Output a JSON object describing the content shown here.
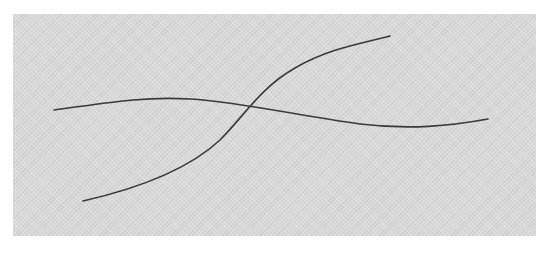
{
  "figure": {
    "background_color": "#ffffff",
    "panel_color": "#d9d9d9",
    "line_color": "#3a3a3a",
    "curves": [
      {
        "name": "curve-a",
        "description": "gently undulating near-horizontal curve",
        "path": "M54,110 C100,104 140,96 190,99 C240,102 300,116 360,124 C410,130 450,126 488,119"
      },
      {
        "name": "curve-b",
        "description": "rising S-shaped curve",
        "path": "M83,201 C140,188 190,168 220,140 C245,115 260,88 295,68 C330,48 360,44 390,36"
      }
    ],
    "intersection": {
      "x": 250,
      "y": 104
    }
  }
}
